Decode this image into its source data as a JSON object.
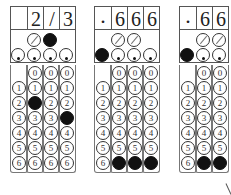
{
  "grids": [
    {
      "answer": [
        "",
        "2",
        "/",
        "3"
      ],
      "slash_row": {
        "col2": false,
        "col3": true
      },
      "decimal_row": {
        "col1": false,
        "col2": false,
        "col3": false,
        "col4": false
      },
      "digits": [
        "0",
        "1",
        "2",
        "3",
        "4",
        "5",
        "6"
      ],
      "filled": {
        "col2": "2",
        "col4": "3"
      }
    },
    {
      "answer": [
        ".",
        "6",
        "6",
        "6"
      ],
      "slash_row": {
        "col2": false,
        "col3": false
      },
      "decimal_row": {
        "col1": true,
        "col2": false,
        "col3": false,
        "col4": false
      },
      "digits": [
        "0",
        "1",
        "2",
        "3",
        "4",
        "5",
        "6"
      ],
      "filled": {
        "col2": "6",
        "col3": "6",
        "col4": "6"
      }
    },
    {
      "answer": [
        ".",
        "6",
        "6"
      ],
      "slash_row": {
        "col2": false,
        "col3": false
      },
      "decimal_row": {
        "col1": true,
        "col2": false,
        "col3": false
      },
      "digits": [
        "0",
        "1",
        "2",
        "3",
        "4",
        "5",
        "6"
      ],
      "filled": {
        "col2": "6",
        "col3": "6"
      }
    }
  ],
  "labels": {
    "d0": "0",
    "d1": "1",
    "d2": "2",
    "d3": "3",
    "d4": "4",
    "d5": "5",
    "d6": "6",
    "g1_h1": "",
    "g1_h2": "2",
    "g1_h3": "/",
    "g1_h4": "3",
    "g2_h1": ".",
    "g2_h2": "6",
    "g2_h3": "6",
    "g2_h4": "6",
    "g3_h1": ".",
    "g3_h2": "6",
    "g3_h3": "6"
  }
}
